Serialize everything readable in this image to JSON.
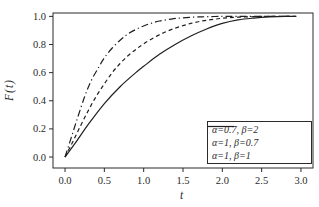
{
  "figure": {
    "background": "#ffffff",
    "ink_color": "#2b2b2b",
    "curve_color": "#1f1f1f"
  },
  "chart_data": {
    "type": "line",
    "title": "",
    "xlabel": "t",
    "ylabel": "F(t)",
    "xlim": [
      -0.153,
      3.153
    ],
    "ylim": [
      -0.078,
      1.024
    ],
    "x_ticks": [
      "0.0",
      "0.5",
      "1.0",
      "1.5",
      "2.0",
      "2.5",
      "3.0"
    ],
    "x_tick_values": [
      0,
      0.5,
      1.0,
      1.5,
      2.0,
      2.5,
      3.0
    ],
    "y_ticks": [
      "0.0",
      "0.2",
      "0.4",
      "0.6",
      "0.8",
      "1.0"
    ],
    "y_tick_values": [
      0,
      0.2,
      0.4,
      0.6,
      0.8,
      1.0
    ],
    "grid": false,
    "legend_position": "lower right",
    "series": [
      {
        "name": "α=0.7, β=2",
        "line_style": "dashdot",
        "points": [
          [
            0,
            0
          ],
          [
            0.08,
            0.14
          ],
          [
            0.16,
            0.28
          ],
          [
            0.25,
            0.43
          ],
          [
            0.33,
            0.54
          ],
          [
            0.42,
            0.63
          ],
          [
            0.5,
            0.705
          ],
          [
            0.6,
            0.775
          ],
          [
            0.7,
            0.83
          ],
          [
            0.8,
            0.875
          ],
          [
            0.9,
            0.907
          ],
          [
            1.0,
            0.932
          ],
          [
            1.1,
            0.952
          ],
          [
            1.2,
            0.967
          ],
          [
            1.35,
            0.981
          ],
          [
            1.5,
            0.99
          ],
          [
            1.7,
            0.996
          ],
          [
            1.9,
            0.999
          ],
          [
            2.1,
            1.0
          ],
          [
            2.5,
            1.0
          ],
          [
            2.94,
            1.0
          ]
        ]
      },
      {
        "name": "α=1, β=0.7",
        "line_style": "dashed",
        "points": [
          [
            0,
            0
          ],
          [
            0.1,
            0.11
          ],
          [
            0.2,
            0.225
          ],
          [
            0.3,
            0.335
          ],
          [
            0.4,
            0.435
          ],
          [
            0.5,
            0.52
          ],
          [
            0.6,
            0.6
          ],
          [
            0.7,
            0.665
          ],
          [
            0.8,
            0.72
          ],
          [
            0.9,
            0.765
          ],
          [
            1.0,
            0.805
          ],
          [
            1.15,
            0.855
          ],
          [
            1.3,
            0.895
          ],
          [
            1.45,
            0.925
          ],
          [
            1.6,
            0.95
          ],
          [
            1.75,
            0.968
          ],
          [
            1.9,
            0.98
          ],
          [
            2.05,
            0.989
          ],
          [
            2.2,
            0.994
          ],
          [
            2.4,
            0.998
          ],
          [
            2.6,
            1.0
          ],
          [
            2.94,
            1.0
          ]
        ]
      },
      {
        "name": "α=1, β=1",
        "line_style": "solid",
        "points": [
          [
            0,
            0
          ],
          [
            0.15,
            0.115
          ],
          [
            0.3,
            0.235
          ],
          [
            0.5,
            0.38
          ],
          [
            0.7,
            0.5
          ],
          [
            0.9,
            0.6
          ],
          [
            1.0,
            0.645
          ],
          [
            1.2,
            0.73
          ],
          [
            1.4,
            0.8
          ],
          [
            1.6,
            0.86
          ],
          [
            1.8,
            0.91
          ],
          [
            2.0,
            0.95
          ],
          [
            2.2,
            0.975
          ],
          [
            2.4,
            0.988
          ],
          [
            2.6,
            0.996
          ],
          [
            2.8,
            1.0
          ],
          [
            2.94,
            1.0
          ]
        ]
      }
    ]
  }
}
